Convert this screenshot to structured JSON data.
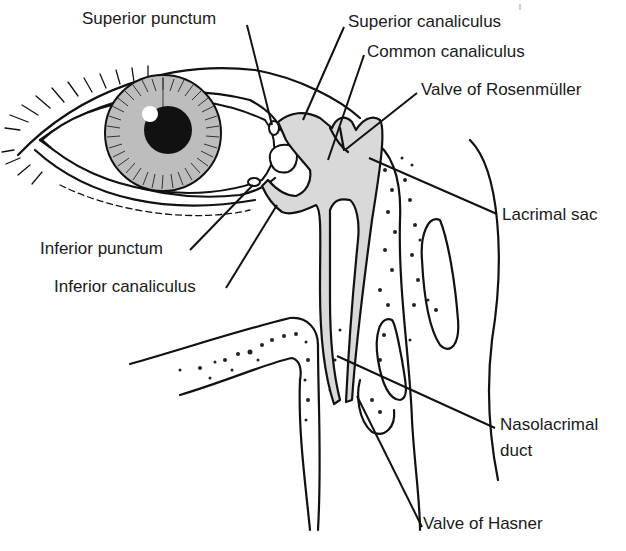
{
  "figure": {
    "labels": [
      {
        "id": "superior-punctum",
        "text": "Superior punctum",
        "x": 82,
        "y": 9
      },
      {
        "id": "superior-canaliculus",
        "text": "Superior canaliculus",
        "x": 348,
        "y": 12
      },
      {
        "id": "common-canaliculus",
        "text": "Common canaliculus",
        "x": 367,
        "y": 42
      },
      {
        "id": "valve-of-rosenmuller",
        "text": "Valve of Rosenmüller",
        "x": 421,
        "y": 80
      },
      {
        "id": "lacrimal-sac",
        "text": "Lacrimal sac",
        "x": 502,
        "y": 205
      },
      {
        "id": "inferior-punctum",
        "text": "Inferior punctum",
        "x": 40,
        "y": 239
      },
      {
        "id": "inferior-canaliculus",
        "text": "Inferior canaliculus",
        "x": 54,
        "y": 277
      },
      {
        "id": "nasolacrimal-duct-line1",
        "text": "Nasolacrimal",
        "x": 500,
        "y": 415
      },
      {
        "id": "nasolacrimal-duct-line2",
        "text": "duct",
        "x": 500,
        "y": 441
      },
      {
        "id": "valve-of-hasner",
        "text": "Valve of Hasner",
        "x": 423,
        "y": 514
      }
    ]
  },
  "colors": {
    "ink": "#111111",
    "duct_fill": "#d9d9d9",
    "iris_fill": "#bdbdbd",
    "background": "#ffffff"
  }
}
